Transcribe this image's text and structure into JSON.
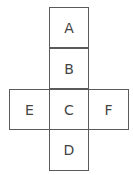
{
  "diagram": {
    "faces": [
      {
        "label": "A",
        "col": 1,
        "row": 0
      },
      {
        "label": "B",
        "col": 1,
        "row": 1
      },
      {
        "label": "E",
        "col": 0,
        "row": 2
      },
      {
        "label": "C",
        "col": 1,
        "row": 2
      },
      {
        "label": "F",
        "col": 2,
        "row": 2
      },
      {
        "label": "D",
        "col": 1,
        "row": 3
      }
    ]
  }
}
